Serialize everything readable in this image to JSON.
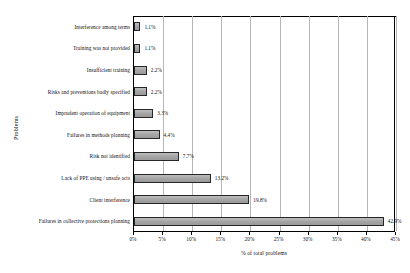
{
  "chart_data": {
    "type": "bar",
    "orientation": "horizontal",
    "title": "",
    "xlabel": "% of total problems",
    "ylabel": "Problems",
    "xlim": [
      0,
      45
    ],
    "xtick_labels": [
      "0%",
      "5%",
      "10%",
      "15%",
      "20%",
      "25%",
      "30%",
      "35%",
      "40%",
      "45%"
    ],
    "xtick_values": [
      0,
      5,
      10,
      15,
      20,
      25,
      30,
      35,
      40,
      45
    ],
    "grid": "vertical",
    "legend": "none",
    "categories": [
      "Interference among terms",
      "Training was not provided",
      "Insufficient training",
      "Risks and preventions badly specified",
      "Imprudent operation of equipment",
      "Failures in methods planning",
      "Risk not identified",
      "Lack of PPE using / unsafe acts",
      "Client interference",
      "Failures in collective protections planning"
    ],
    "values": [
      1.1,
      1.1,
      2.2,
      2.2,
      3.3,
      4.4,
      7.7,
      13.2,
      19.8,
      42.9
    ],
    "value_labels": [
      "1.1%",
      "1.1%",
      "2.2%",
      "2.2%",
      "3.3%",
      "4.4%",
      "7.7%",
      "13.2%",
      "19.8%",
      "42.9%"
    ],
    "bar_fill_color": "#a8a8a8",
    "bar_edge_color": "#262626",
    "gridline_color": "#b6b6b6",
    "axis_color": "#000000",
    "background_color": "#ffffff"
  }
}
